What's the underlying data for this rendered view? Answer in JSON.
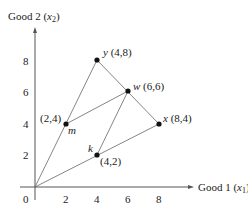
{
  "diagram": {
    "y_axis_label": {
      "prefix": "Good 2 (",
      "var": "x",
      "sub": "2",
      "suffix": ")"
    },
    "x_axis_label": {
      "prefix": "Good 1 (",
      "var": "x",
      "sub": "1",
      "suffix": ")"
    },
    "origin_label": "0",
    "x_ticks": [
      "2",
      "4",
      "6",
      "8"
    ],
    "y_ticks": [
      "2",
      "4",
      "6",
      "8"
    ],
    "points": [
      {
        "name": "y",
        "coords": "(4,8)",
        "x": 4,
        "y": 8
      },
      {
        "name": "w",
        "coords": "(6,6)",
        "x": 6,
        "y": 6
      },
      {
        "name": "x",
        "coords": "(8,4)",
        "x": 8,
        "y": 4
      },
      {
        "name": "m",
        "coords": "(2,4)",
        "x": 2,
        "y": 4
      },
      {
        "name": "k",
        "coords": "(4,2)",
        "x": 4,
        "y": 2
      }
    ],
    "segments": [
      [
        "origin",
        "y"
      ],
      [
        "origin",
        "x"
      ],
      [
        "y",
        "x"
      ],
      [
        "m",
        "w"
      ],
      [
        "k",
        "w"
      ]
    ]
  }
}
